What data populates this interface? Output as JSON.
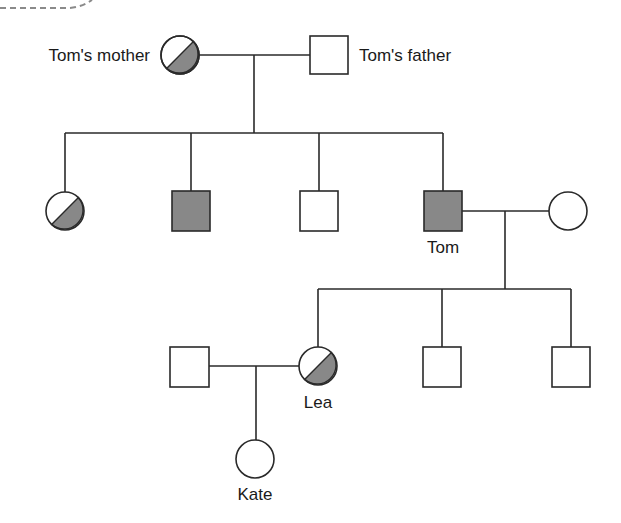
{
  "diagram": {
    "type": "pedigree",
    "colors": {
      "affected_fill": "#888888",
      "unaffected_fill": "#ffffff",
      "line": "#2a2a2a",
      "dashed_decoration": "#8a8a8a"
    },
    "legend_semantics": {
      "square": "male",
      "circle": "female",
      "filled": "affected",
      "half_filled": "carrier"
    },
    "generations": [
      {
        "id": "I",
        "individuals": [
          {
            "id": "toms-mother",
            "label": "Tom's mother",
            "sex": "female",
            "status": "carrier"
          },
          {
            "id": "toms-father",
            "label": "Tom's father",
            "sex": "male",
            "status": "unaffected"
          }
        ]
      },
      {
        "id": "II",
        "individuals": [
          {
            "id": "ii-1",
            "label": "",
            "sex": "female",
            "status": "carrier"
          },
          {
            "id": "ii-2",
            "label": "",
            "sex": "male",
            "status": "affected"
          },
          {
            "id": "ii-3",
            "label": "",
            "sex": "male",
            "status": "unaffected"
          },
          {
            "id": "tom",
            "label": "Tom",
            "sex": "male",
            "status": "affected"
          },
          {
            "id": "toms-wife",
            "label": "",
            "sex": "female",
            "status": "unaffected"
          }
        ]
      },
      {
        "id": "III",
        "individuals": [
          {
            "id": "leas-husband",
            "label": "",
            "sex": "male",
            "status": "unaffected"
          },
          {
            "id": "lea",
            "label": "Lea",
            "sex": "female",
            "status": "carrier"
          },
          {
            "id": "iii-3",
            "label": "",
            "sex": "male",
            "status": "unaffected"
          },
          {
            "id": "iii-4",
            "label": "",
            "sex": "male",
            "status": "unaffected"
          }
        ]
      },
      {
        "id": "IV",
        "individuals": [
          {
            "id": "kate",
            "label": "Kate",
            "sex": "female",
            "status": "unknown"
          }
        ]
      }
    ],
    "labels": {
      "toms_mother": "Tom's mother",
      "toms_father": "Tom's father",
      "tom": "Tom",
      "lea": "Lea",
      "kate": "Kate"
    }
  }
}
